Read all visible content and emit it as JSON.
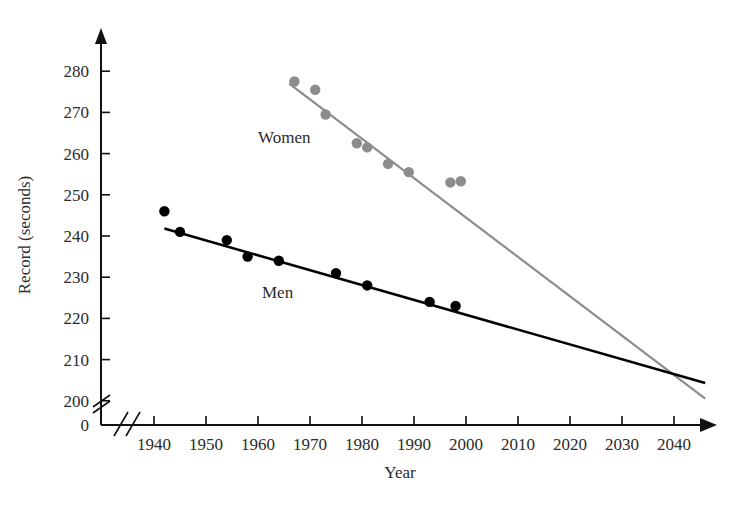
{
  "chart_data": {
    "type": "scatter",
    "title": "",
    "xlabel": "Year",
    "ylabel": "Record (seconds)",
    "xlim": [
      1935,
      2047
    ],
    "ylim": [
      196,
      284
    ],
    "grid": false,
    "legend_position": "inline-labels",
    "axis_breaks": {
      "y_break_below": 200,
      "x_break_before": 1940,
      "y_zero_label": "0"
    },
    "xticks": [
      1940,
      1950,
      1960,
      1970,
      1980,
      1990,
      2000,
      2010,
      2020,
      2030,
      2040
    ],
    "xtick_labels": [
      "1940",
      "1950",
      "1960",
      "1970",
      "1980",
      "1990",
      "2000",
      "2010",
      "2020",
      "2030",
      "2040"
    ],
    "yticks": [
      200,
      210,
      220,
      230,
      240,
      250,
      260,
      270,
      280
    ],
    "ytick_labels": [
      "200",
      "210",
      "220",
      "230",
      "240",
      "250",
      "260",
      "270",
      "280"
    ],
    "series": [
      {
        "name": "Women",
        "color": "#8c8c8c",
        "label_text": "Women",
        "points": [
          {
            "x": 1967,
            "y": 277.5
          },
          {
            "x": 1971,
            "y": 275.5
          },
          {
            "x": 1973,
            "y": 269.5
          },
          {
            "x": 1979,
            "y": 262.5
          },
          {
            "x": 1981,
            "y": 261.5
          },
          {
            "x": 1985,
            "y": 257.5
          },
          {
            "x": 1989,
            "y": 255.5
          },
          {
            "x": 1997,
            "y": 253.0
          },
          {
            "x": 1999,
            "y": 253.3
          }
        ],
        "trendline": {
          "x1": 1966,
          "y1": 277.0,
          "x2": 2046,
          "y2": 200.5
        }
      },
      {
        "name": "Men",
        "color": "#000000",
        "label_text": "Men",
        "points": [
          {
            "x": 1942,
            "y": 246.0
          },
          {
            "x": 1945,
            "y": 241.0
          },
          {
            "x": 1954,
            "y": 239.0
          },
          {
            "x": 1958,
            "y": 235.0
          },
          {
            "x": 1964,
            "y": 234.0
          },
          {
            "x": 1975,
            "y": 231.0
          },
          {
            "x": 1981,
            "y": 228.0
          },
          {
            "x": 1993,
            "y": 224.0
          },
          {
            "x": 1998,
            "y": 223.0
          }
        ],
        "trendline": {
          "x1": 1942,
          "y1": 241.8,
          "x2": 2046,
          "y2": 204.3
        }
      }
    ]
  },
  "labels": {
    "y_axis_title": "Record (seconds)",
    "x_axis_title": "Year",
    "women": "Women",
    "men": "Men",
    "zero": "0"
  }
}
